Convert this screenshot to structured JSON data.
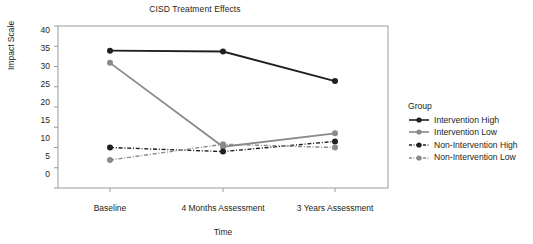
{
  "chart_data": {
    "type": "line",
    "title": "CISD Treatment Effects",
    "xlabel": "Time",
    "ylabel": "Impact Scale",
    "categories": [
      "Baseline",
      "4 Months Assessment",
      "3 Years Assessment"
    ],
    "ylim": [
      0,
      40
    ],
    "yticks": [
      0,
      5,
      10,
      15,
      20,
      25,
      30,
      35,
      40
    ],
    "ytick_labels": [
      "0",
      "5",
      "10",
      "15",
      "20",
      "25",
      "30",
      "35",
      "40"
    ],
    "grid": false,
    "legend_title": "Group",
    "legend_position": "right",
    "series": [
      {
        "name": "Intervention High",
        "values": [
          33.9,
          33.7,
          26.4
        ],
        "color": "#231f20",
        "linestyle": "solid",
        "marker": "circle"
      },
      {
        "name": "Intervention Low",
        "values": [
          30.9,
          10.2,
          13.5
        ],
        "color": "#8a8a8a",
        "linestyle": "solid",
        "marker": "circle"
      },
      {
        "name": "Non-Intervention High",
        "values": [
          10.0,
          9.0,
          11.5
        ],
        "color": "#231f20",
        "linestyle": "dashdot",
        "marker": "circle"
      },
      {
        "name": "Non-Intervention Low",
        "values": [
          6.9,
          10.8,
          10.0
        ],
        "color": "#8a8a8a",
        "linestyle": "dashdot",
        "marker": "circle"
      }
    ]
  },
  "legend": {
    "title": "Group",
    "items": [
      {
        "label": "Intervention High"
      },
      {
        "label": "Intervention Low"
      },
      {
        "label": "Non-Intervention High"
      },
      {
        "label": "Non-Intervention Low"
      }
    ]
  },
  "axes": {
    "y_label": "Impact Scale",
    "x_label": "Time",
    "y_ticks": [
      "40",
      "35",
      "30",
      "25",
      "20",
      "15",
      "10",
      "5",
      "0"
    ],
    "x_ticks": [
      "Baseline",
      "4 Months Assessment",
      "3 Years Assessment"
    ]
  },
  "title": "CISD Treatment Effects",
  "colors": {
    "high": "#231f20",
    "low": "#8a8a8a",
    "frame": "#9b9b9b",
    "background": "#ffffff"
  }
}
